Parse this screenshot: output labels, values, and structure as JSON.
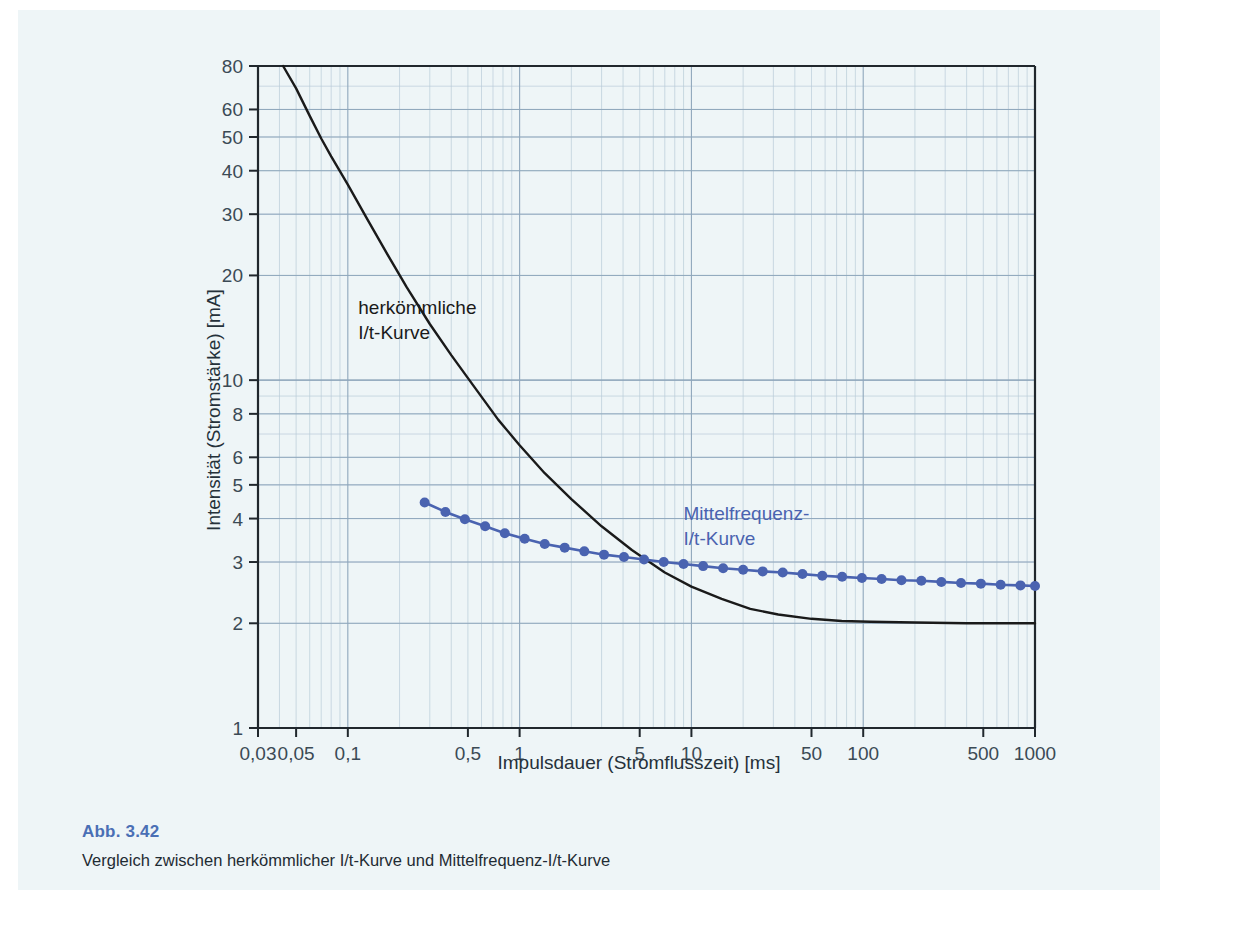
{
  "figure": {
    "number": "Abb. 3.42",
    "caption": "Vergleich zwischen herkömmlicher I/t-Kurve und Mittelfrequenz-I/t-Kurve",
    "accent_color": "#4a6fb5",
    "panel_color": "#eef5f7"
  },
  "chart_data": {
    "type": "line",
    "title": "",
    "xlabel": "Impulsdauer (Stromflusszeit) [ms]",
    "ylabel": "Intensität (Stromstärke) [mA]",
    "xscale": "log",
    "yscale": "log",
    "xlim": [
      0.03,
      1000
    ],
    "ylim": [
      1,
      80
    ],
    "grid": true,
    "grid_color": "#8fa7bc",
    "minor_grid_color": "#b9cbd9",
    "legend": "annotations",
    "xticks": [
      0.03,
      0.05,
      0.1,
      0.5,
      1,
      5,
      10,
      50,
      100,
      500,
      1000
    ],
    "xticklabels": [
      "0,03",
      "0,05",
      "0,1",
      "0,5",
      "1",
      "5",
      "10",
      "50",
      "100",
      "500",
      "1000"
    ],
    "yticks": [
      1,
      2,
      3,
      4,
      5,
      6,
      8,
      10,
      20,
      30,
      40,
      50,
      60,
      80
    ],
    "yticklabels": [
      "1",
      "2",
      "3",
      "4",
      "5",
      "6",
      "8",
      "10",
      "20",
      "30",
      "40",
      "50",
      "60",
      "80"
    ],
    "series": [
      {
        "name": "herkömmliche I/t-Kurve",
        "color": "#1a1a1a",
        "marker": "none",
        "annotation": [
          "herkömmliche",
          "I/t-Kurve"
        ],
        "annotation_x": 0.115,
        "annotation_y": 15.5,
        "x": [
          0.042,
          0.05,
          0.06,
          0.07,
          0.08,
          0.1,
          0.13,
          0.17,
          0.22,
          0.3,
          0.4,
          0.55,
          0.75,
          1.0,
          1.4,
          2.0,
          3.0,
          4.5,
          7.0,
          10,
          15,
          22,
          32,
          50,
          75,
          110,
          200,
          400,
          1000
        ],
        "y": [
          80,
          69,
          57.5,
          49.5,
          44,
          36.5,
          29.0,
          23.0,
          18.5,
          14.5,
          11.8,
          9.5,
          7.7,
          6.5,
          5.4,
          4.55,
          3.8,
          3.25,
          2.8,
          2.55,
          2.35,
          2.2,
          2.12,
          2.06,
          2.03,
          2.02,
          2.01,
          2.0,
          2.0
        ]
      },
      {
        "name": "Mittelfrequenz-I/t-Kurve",
        "color": "#4a63b0",
        "marker": "circle",
        "annotation": [
          "Mittelfrequenz-",
          "I/t-Kurve"
        ],
        "annotation_x": 9.0,
        "annotation_y": 3.95,
        "x": [
          0.28,
          0.37,
          0.48,
          0.63,
          0.82,
          1.07,
          1.4,
          1.83,
          2.38,
          3.1,
          4.05,
          5.3,
          6.9,
          9.0,
          11.7,
          15.3,
          20.0,
          26.0,
          34.0,
          44.3,
          57.8,
          75.4,
          98.3,
          128,
          167,
          218,
          285,
          371,
          484,
          631,
          823,
          1000
        ],
        "y": [
          4.45,
          4.18,
          3.98,
          3.8,
          3.63,
          3.5,
          3.38,
          3.3,
          3.22,
          3.15,
          3.1,
          3.05,
          3.0,
          2.96,
          2.92,
          2.88,
          2.85,
          2.82,
          2.8,
          2.77,
          2.74,
          2.72,
          2.7,
          2.68,
          2.66,
          2.65,
          2.63,
          2.61,
          2.6,
          2.58,
          2.57,
          2.56
        ]
      }
    ]
  }
}
